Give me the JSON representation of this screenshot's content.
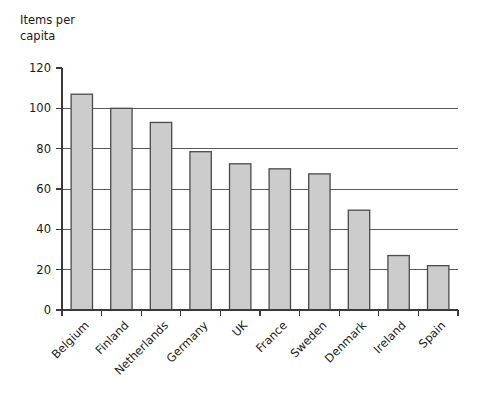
{
  "chart_data": {
    "type": "bar",
    "title": "",
    "ylabel": "Items per capita",
    "ylabel_lines": [
      "Items per",
      "capita"
    ],
    "xlabel": "",
    "categories": [
      "Belgium",
      "Finland",
      "Netherlands",
      "Germany",
      "UK",
      "France",
      "Sweden",
      "Denmark",
      "Ireland",
      "Spain"
    ],
    "values": [
      107,
      100,
      93,
      78.5,
      72.5,
      70,
      67.5,
      49.5,
      27,
      22
    ],
    "ylim": [
      0,
      120
    ],
    "yticks": [
      0,
      20,
      40,
      60,
      80,
      100,
      120
    ],
    "ytick_labels": [
      "0",
      "20",
      "40",
      "60",
      "80",
      "100",
      "120"
    ],
    "grid": "horizontal",
    "legend": "none",
    "bar_fill": "#cccccc",
    "bar_edge": "#4a4a4a",
    "background": "#ffffff",
    "xtick_label_rotation": -45
  }
}
